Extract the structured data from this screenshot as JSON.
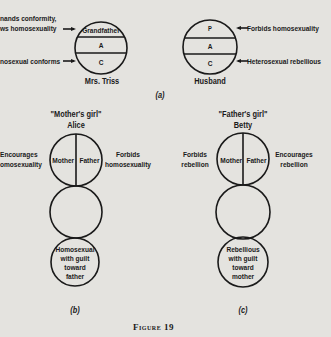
{
  "figure_caption": "Figure 19",
  "panel_a": {
    "label": "(a)",
    "mrs_triss": {
      "name": "Mrs. Triss",
      "sections": [
        "Grandfather",
        "A",
        "C"
      ],
      "left_labels": {
        "top_line1": "nands conformity,",
        "top_line2": "ws homosexuality",
        "bottom": "nosexual conforms"
      }
    },
    "husband": {
      "name": "Husband",
      "sections": [
        "P",
        "A",
        "C"
      ],
      "right_labels": {
        "top": "Forbids homosexuality",
        "bottom": "Heterosexual rebellious"
      }
    }
  },
  "panel_b": {
    "label": "(b)",
    "title": "\"Mother's girl\"",
    "name": "Alice",
    "top_sections": [
      "Mother",
      "Father"
    ],
    "left_label_line1": "Encourages",
    "left_label_line2": "omosexuality",
    "right_label_line1": "Forbids",
    "right_label_line2": "homosexuality",
    "bottom_lines": [
      "Homosexual",
      "with guilt",
      "toward",
      "father"
    ]
  },
  "panel_c": {
    "label": "(c)",
    "title": "\"Father's girl\"",
    "name": "Betty",
    "top_sections": [
      "Mother",
      "Father"
    ],
    "left_label_line1": "Forbids",
    "left_label_line2": "rebellion",
    "right_label_line1": "Encourages",
    "right_label_line2": "rebellion",
    "bottom_lines": [
      "Rebellious",
      "with guilt",
      "toward",
      "mother"
    ]
  },
  "colors": {
    "paper": "#e4e3df",
    "ink": "#1a1a1a"
  }
}
